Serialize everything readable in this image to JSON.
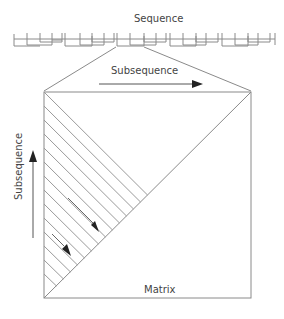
{
  "diagram": {
    "labels": {
      "sequence": "Sequence",
      "subsequence_horizontal": "Subsequence",
      "subsequence_vertical": "Subsequence",
      "matrix": "Matrix"
    },
    "colors": {
      "line": "#8a8a8a",
      "arrow": "#222222",
      "text": "#444444",
      "background": "#ffffff"
    },
    "elements": {
      "sequence_bar": "segmented sequence timeline with alternating step blocks",
      "zoom_lines": "projection lines from highlighted sequence segment to matrix square",
      "matrix_square": "square matrix with anti-diagonal",
      "hatch_lines": "diagonal lines in lower-left triangle running top-left to bottom-right",
      "arrows": [
        "horizontal subsequence arrow (right)",
        "vertical subsequence arrow (up)",
        "two down-right arrows along hatch lines"
      ]
    }
  }
}
